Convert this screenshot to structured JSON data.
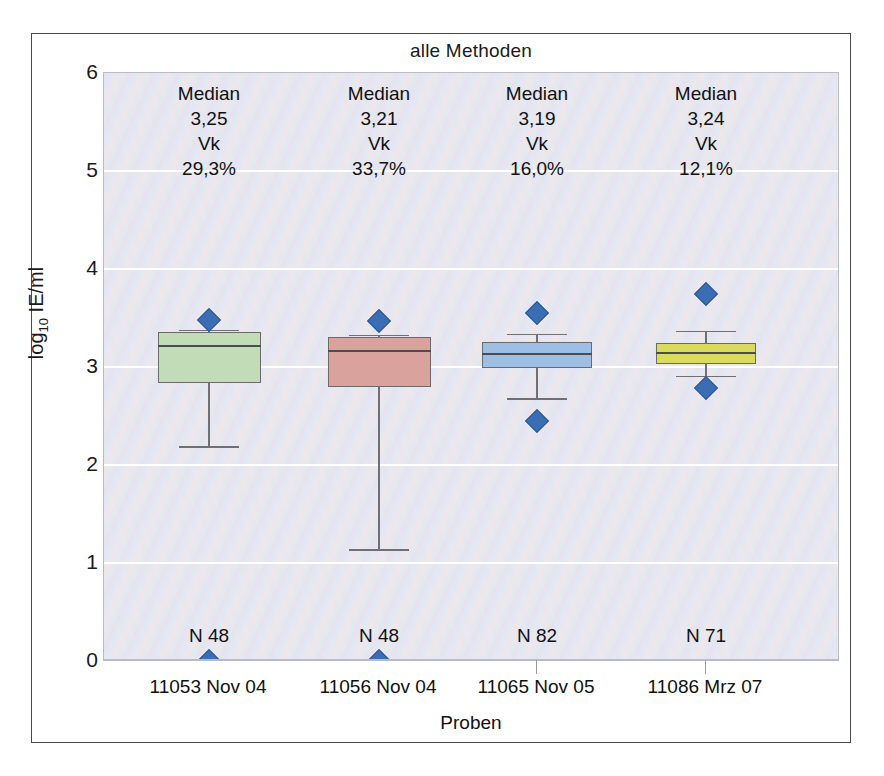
{
  "chart_data": {
    "type": "box",
    "title": "alle Methoden",
    "xlabel": "Proben",
    "ylabel": "log10 IE/ml",
    "ylabel_base": "log",
    "ylabel_sub": "10",
    "ylabel_rest": " IE/ml",
    "ylim": [
      0,
      6
    ],
    "yticks": [
      0,
      1,
      2,
      3,
      4,
      5,
      6
    ],
    "ytick_labels": [
      "0",
      "1",
      "2",
      "3",
      "4",
      "5",
      "6"
    ],
    "grid": "horizontal-white",
    "categories": [
      "11053 Nov 04",
      "11056 Nov 04",
      "11065 Nov 05",
      "11086 Mrz 07"
    ],
    "series": [
      {
        "name": "11053 Nov 04",
        "color": "#c3dcb8",
        "n_label": "N 48",
        "n": 48,
        "median_label": "Median",
        "median_value": "3,25",
        "vk_label": "Vk",
        "vk_value": "29,3%",
        "box_top": 3.36,
        "box_bottom": 2.84,
        "median": 3.22,
        "whisker_high": 3.38,
        "whisker_low": 2.19,
        "outliers": [
          3.48
        ],
        "baseline_marker": 0.0
      },
      {
        "name": "11056 Nov 04",
        "color": "#d9a29c",
        "n_label": "N 48",
        "n": 48,
        "median_label": "Median",
        "median_value": "3,21",
        "vk_label": "Vk",
        "vk_value": "33,7%",
        "box_top": 3.31,
        "box_bottom": 2.8,
        "median": 3.17,
        "whisker_high": 3.33,
        "whisker_low": 1.14,
        "outliers": [
          3.47
        ],
        "baseline_marker": 0.0
      },
      {
        "name": "11065 Nov 05",
        "color": "#9dbfe3",
        "n_label": "N 82",
        "n": 82,
        "median_label": "Median",
        "median_value": "3,19",
        "vk_label": "Vk",
        "vk_value": "16,0%",
        "box_top": 3.26,
        "box_bottom": 2.99,
        "median": 3.14,
        "whisker_high": 3.34,
        "whisker_low": 2.68,
        "outliers": [
          3.55,
          2.45
        ],
        "baseline_marker": null
      },
      {
        "name": "11086 Mrz 07",
        "color": "#d9da5e",
        "n_label": "N 71",
        "n": 71,
        "median_label": "Median",
        "median_value": "3,24",
        "vk_label": "Vk",
        "vk_value": "12,1%",
        "box_top": 3.25,
        "box_bottom": 3.03,
        "median": 3.15,
        "whisker_high": 3.37,
        "whisker_low": 2.91,
        "outliers": [
          3.74,
          2.79
        ],
        "baseline_marker": null
      }
    ],
    "colors": {
      "outlier_marker": "#3b6db5",
      "grid": "#ffffff",
      "plot_background": "#e6e6f0",
      "frame": "#4a4a4a"
    }
  }
}
